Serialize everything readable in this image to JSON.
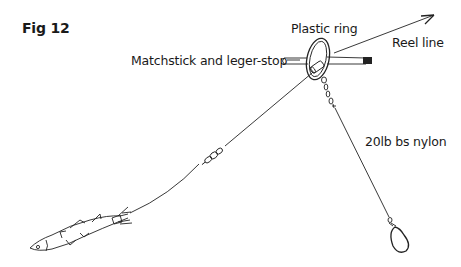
{
  "figure": {
    "title": "Fig 12",
    "type": "fishing rig illustration"
  },
  "labels": {
    "plastic_ring": "Plastic ring",
    "matchstick": "Matchstick and leger-stop",
    "reel_line": "Reel line",
    "nylon": "20lb bs nylon"
  },
  "components": [
    {
      "name": "plastic-ring",
      "label": "Plastic ring"
    },
    {
      "name": "matchstick-leger-stop",
      "label": "Matchstick and leger-stop"
    },
    {
      "name": "reel-line",
      "label": "Reel line"
    },
    {
      "name": "nylon-link",
      "label": "20lb bs nylon"
    },
    {
      "name": "swivel"
    },
    {
      "name": "bait-fish"
    },
    {
      "name": "lead-weight"
    }
  ],
  "colors": {
    "ink": "#222222",
    "background": "#ffffff"
  }
}
